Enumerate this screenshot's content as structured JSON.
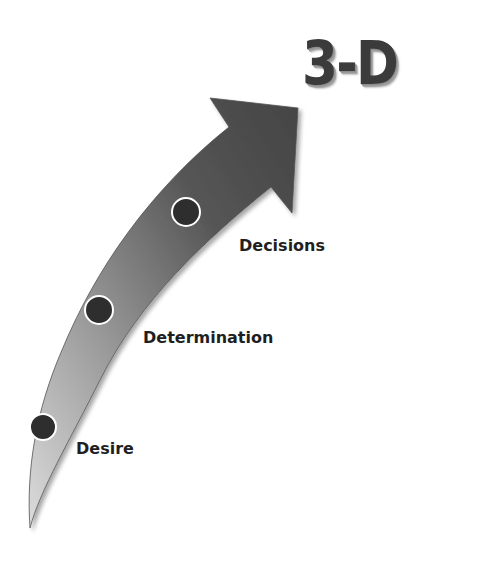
{
  "diagram": {
    "title": "3-D",
    "stages": [
      {
        "label": "Desire",
        "order": 1
      },
      {
        "label": "Determination",
        "order": 2
      },
      {
        "label": "Decisions",
        "order": 3
      }
    ],
    "colors": {
      "arrow_dark": "#4a4a4a",
      "arrow_light": "#c4c4c4",
      "marker_fill": "#2e2e2e",
      "marker_ring": "#ffffff",
      "label_text": "#1f1f1f",
      "title_text": "#3b3b3b"
    },
    "icons": {
      "arrow": "curved-upward-arrow-icon",
      "marker": "milestone-dot-icon"
    }
  }
}
